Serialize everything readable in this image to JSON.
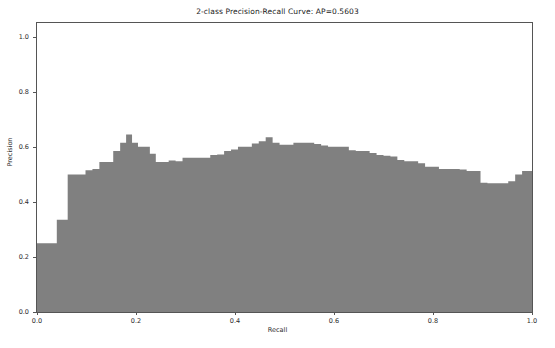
{
  "chart_data": {
    "type": "area",
    "title": "2-class Precision-Recall Curve: AP=0.5603",
    "xlabel": "Recall",
    "ylabel": "Precision",
    "xlim": [
      0.0,
      1.0
    ],
    "ylim": [
      0.0,
      1.05
    ],
    "grid": false,
    "legend": null,
    "average_precision": 0.5603,
    "fill_color": "#808080",
    "step_style": "post",
    "xticks": [
      "0.0",
      "0.2",
      "0.4",
      "0.6",
      "0.8",
      "1.0"
    ],
    "xtick_values": [
      0.0,
      0.2,
      0.4,
      0.6,
      0.8,
      1.0
    ],
    "yticks": [
      "0.0",
      "0.2",
      "0.4",
      "0.6",
      "0.8",
      "1.0"
    ],
    "ytick_values": [
      0.0,
      0.2,
      0.4,
      0.6,
      0.8,
      1.0
    ],
    "x": [
      0.0,
      0.008,
      0.016,
      0.024,
      0.032,
      0.04,
      0.05,
      0.062,
      0.074,
      0.086,
      0.098,
      0.112,
      0.126,
      0.14,
      0.154,
      0.168,
      0.18,
      0.192,
      0.204,
      0.216,
      0.228,
      0.24,
      0.252,
      0.266,
      0.28,
      0.294,
      0.308,
      0.322,
      0.336,
      0.35,
      0.364,
      0.378,
      0.392,
      0.406,
      0.42,
      0.434,
      0.448,
      0.462,
      0.476,
      0.49,
      0.504,
      0.518,
      0.532,
      0.546,
      0.56,
      0.574,
      0.588,
      0.602,
      0.616,
      0.63,
      0.644,
      0.658,
      0.672,
      0.686,
      0.7,
      0.714,
      0.728,
      0.742,
      0.756,
      0.77,
      0.784,
      0.798,
      0.812,
      0.826,
      0.84,
      0.854,
      0.868,
      0.882,
      0.896,
      0.91,
      0.924,
      0.938,
      0.952,
      0.966,
      0.98,
      1.0
    ],
    "y": [
      0.25,
      0.25,
      0.25,
      0.25,
      0.25,
      0.335,
      0.335,
      0.5,
      0.5,
      0.5,
      0.515,
      0.52,
      0.545,
      0.545,
      0.585,
      0.615,
      0.645,
      0.615,
      0.6,
      0.6,
      0.575,
      0.545,
      0.545,
      0.55,
      0.548,
      0.56,
      0.56,
      0.56,
      0.56,
      0.57,
      0.572,
      0.585,
      0.59,
      0.6,
      0.6,
      0.612,
      0.62,
      0.635,
      0.615,
      0.608,
      0.608,
      0.615,
      0.615,
      0.615,
      0.61,
      0.605,
      0.6,
      0.6,
      0.6,
      0.588,
      0.585,
      0.585,
      0.578,
      0.57,
      0.568,
      0.565,
      0.552,
      0.548,
      0.548,
      0.54,
      0.528,
      0.528,
      0.52,
      0.52,
      0.52,
      0.518,
      0.512,
      0.512,
      0.47,
      0.468,
      0.468,
      0.468,
      0.475,
      0.5,
      0.512,
      0.512
    ]
  }
}
